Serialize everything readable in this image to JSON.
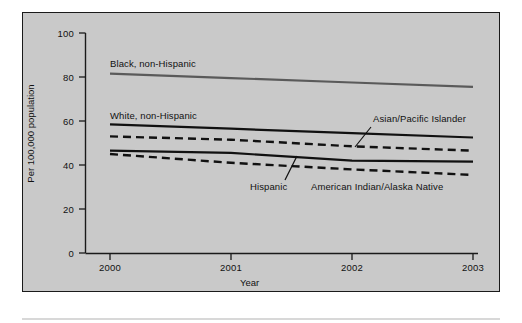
{
  "figure": {
    "panel_bg": "#c9c9c9",
    "frame_color": "#1a1a1a"
  },
  "axes": {
    "ylabel": "Per 100,000 population",
    "xlabel": "Year",
    "yticks": [
      "100",
      "80",
      "60",
      "40",
      "20",
      "0"
    ],
    "xticks": [
      "2000",
      "2001",
      "2002",
      "2003"
    ]
  },
  "annotations": {
    "black": "Black, non-Hispanic",
    "white": "White, non-Hispanic",
    "asian": "Asian/Pacific Islander",
    "hispanic": "Hispanic",
    "aian": "American Indian/Alaska Native"
  },
  "chart_data": {
    "type": "line",
    "title": "",
    "xlabel": "Year",
    "ylabel": "Per 100,000 population",
    "x": [
      2000,
      2001,
      2002,
      2003
    ],
    "xlim": [
      2000,
      2003
    ],
    "ylim": [
      0,
      100
    ],
    "yticks": [
      0,
      20,
      40,
      60,
      80,
      100
    ],
    "grid": false,
    "legend": "inline-annotations",
    "series": [
      {
        "name": "Black, non-Hispanic",
        "style": "solid",
        "color": "#5a5a5a",
        "values": [
          81.5,
          79.5,
          77.5,
          75.5
        ]
      },
      {
        "name": "White, non-Hispanic",
        "style": "solid",
        "color": "#111111",
        "values": [
          58.5,
          56.5,
          54.5,
          52.5
        ]
      },
      {
        "name": "Asian/Pacific Islander",
        "style": "dashed",
        "color": "#111111",
        "values": [
          53.0,
          51.5,
          48.5,
          46.5
        ]
      },
      {
        "name": "Hispanic",
        "style": "solid",
        "color": "#111111",
        "values": [
          46.5,
          45.5,
          42.0,
          41.5
        ]
      },
      {
        "name": "American Indian/Alaska Native",
        "style": "dashed",
        "color": "#111111",
        "values": [
          45.0,
          41.0,
          38.0,
          35.5
        ]
      }
    ]
  }
}
